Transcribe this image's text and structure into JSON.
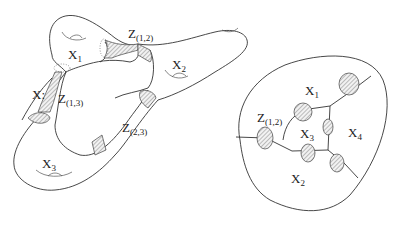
{
  "left_figure": {
    "space_label": "X:",
    "pieces": [
      {
        "name": "X",
        "sub": "1"
      },
      {
        "name": "X",
        "sub": "2"
      },
      {
        "name": "X",
        "sub": "3"
      }
    ],
    "intersections": [
      {
        "name": "Z",
        "sub": "(1,2)"
      },
      {
        "name": "Z",
        "sub": "(1,3)"
      },
      {
        "name": "Z",
        "sub": "(2,3)"
      }
    ]
  },
  "right_figure": {
    "pieces": [
      {
        "name": "X",
        "sub": "1"
      },
      {
        "name": "X",
        "sub": "2"
      },
      {
        "name": "X",
        "sub": "3"
      },
      {
        "name": "X",
        "sub": "4"
      }
    ],
    "intersections": [
      {
        "name": "Z",
        "sub": "(1,2)"
      }
    ]
  },
  "colors": {
    "line": "#333333",
    "hatch": "#777777",
    "background": "#ffffff"
  }
}
